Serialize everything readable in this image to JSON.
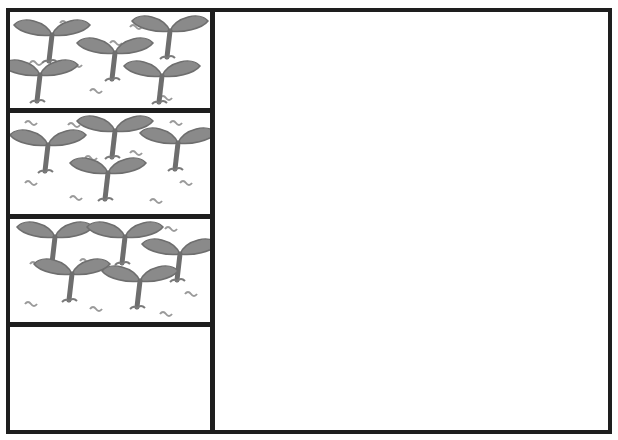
{
  "diagram": {
    "colors": {
      "outline": "#1e1e1e",
      "seedling_fill": "#8a8a8a",
      "seedling_stroke": "#6a6a6a",
      "squiggle": "#9a9a9a",
      "background": "#ffffff"
    },
    "left_column": {
      "cells": [
        {
          "index": 0,
          "content": "seedlings",
          "seedling_count": 5
        },
        {
          "index": 1,
          "content": "seedlings",
          "seedling_count": 5
        },
        {
          "index": 2,
          "content": "seedlings",
          "seedling_count": 5
        },
        {
          "index": 3,
          "content": "empty",
          "seedling_count": 0
        }
      ]
    },
    "right_region": {
      "content": "empty"
    }
  }
}
